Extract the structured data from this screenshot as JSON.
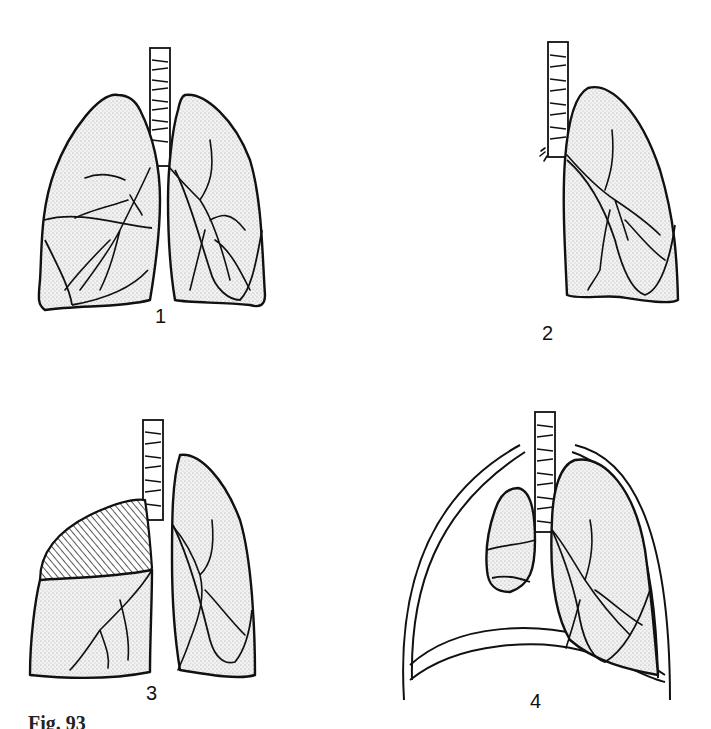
{
  "figure": {
    "caption": "Fig. 93",
    "panels": [
      {
        "id": 1,
        "label": "1",
        "description": "Normal lungs, both sides with trachea and bronchial tree"
      },
      {
        "id": 2,
        "label": "2",
        "description": "Single lung, lateral view with trachea"
      },
      {
        "id": 3,
        "label": "3",
        "description": "Lungs with hatched (collapsed) right upper lobe"
      },
      {
        "id": 4,
        "label": "4",
        "description": "Collapsed lung within chest wall above diaphragm, opposite lung expanded"
      }
    ]
  },
  "colors": {
    "ink": "#111111",
    "background": "#ffffff",
    "stipple": "#d8d8d8"
  }
}
